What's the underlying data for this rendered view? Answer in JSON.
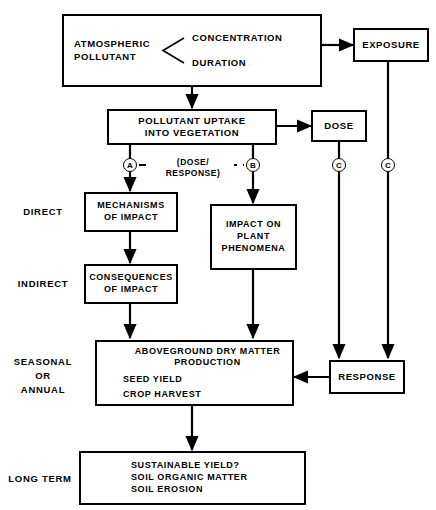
{
  "diagram": {
    "boxes": {
      "atmospheric": {
        "label_line1": "ATMOSPHERIC",
        "label_line2": "POLLUTANT",
        "term1": "CONCENTRATION",
        "term2": "DURATION"
      },
      "exposure": {
        "label": "EXPOSURE"
      },
      "uptake": {
        "line1": "POLLUTANT UPTAKE",
        "line2": "INTO VEGETATION"
      },
      "dose": {
        "label": "DOSE"
      },
      "mechanisms": {
        "line1": "MECHANISMS",
        "line2": "OF IMPACT"
      },
      "impact_plant": {
        "line1": "IMPACT ON",
        "line2": "PLANT",
        "line3": "PHENOMENA"
      },
      "consequences": {
        "line1": "CONSEQUENCES",
        "line2": "OF IMPACT"
      },
      "aboveground": {
        "line1": "ABOVEGROUND  DRY  MATTER",
        "line2": "PRODUCTION",
        "line3": "SEED  YIELD",
        "line4": "CROP  HARVEST"
      },
      "response": {
        "label": "RESPONSE"
      },
      "longterm": {
        "line1": "SUSTAINABLE  YIELD?",
        "line2": "SOIL ORGANIC MATTER",
        "line3": "SOIL EROSION"
      }
    },
    "stage_labels": {
      "direct": "DIRECT",
      "indirect": "INDIRECT",
      "seasonal_l1": "SEASONAL",
      "seasonal_l2": "OR",
      "seasonal_l3": "ANNUAL",
      "long_term": "LONG  TERM"
    },
    "markers": {
      "a": "A",
      "b": "B",
      "c1": "C",
      "c2": "C"
    },
    "connector_label": {
      "line1": "(DOSE/",
      "line2": "RESPONSE)"
    },
    "colors": {
      "stroke": "#000000",
      "background": "#ffffff"
    }
  }
}
